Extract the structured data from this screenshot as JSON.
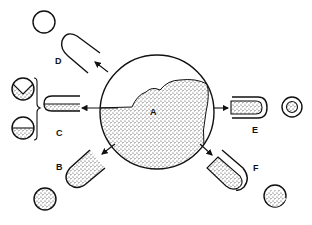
{
  "diagram": {
    "type": "schematic",
    "colors": {
      "ink": "#111111",
      "background": "#ffffff",
      "stipple": "#555555"
    },
    "labels": {
      "A": "A",
      "B": "B",
      "C": "C",
      "D": "D",
      "E": "E",
      "F": "F"
    },
    "nodes": [
      {
        "id": "A",
        "shape": "large circle",
        "content": "stippled irregular mass filling lower portion"
      },
      {
        "id": "D",
        "shape": "open empty capsule (upper-left)",
        "associated": "empty small circle"
      },
      {
        "id": "C",
        "shape": "horizontal capsule, lower half stippled (left)",
        "associated": "two small partially stippled circles joined by a bracket"
      },
      {
        "id": "B",
        "shape": "diagonal stippled capsule (lower-left)",
        "associated": "fully stippled small circle"
      },
      {
        "id": "E",
        "shape": "horizontal stippled capsule within outer sheath (right)",
        "associated": "concentric ring circle with stippled core"
      },
      {
        "id": "F",
        "shape": "diagonal stippled capsule within outer sheath (lower-right)",
        "associated": "small circle partially stippled"
      }
    ],
    "edges": [
      {
        "from": "A",
        "to": "D"
      },
      {
        "from": "A",
        "to": "C"
      },
      {
        "from": "A",
        "to": "B"
      },
      {
        "from": "A",
        "to": "E"
      },
      {
        "from": "A",
        "to": "F"
      }
    ]
  }
}
